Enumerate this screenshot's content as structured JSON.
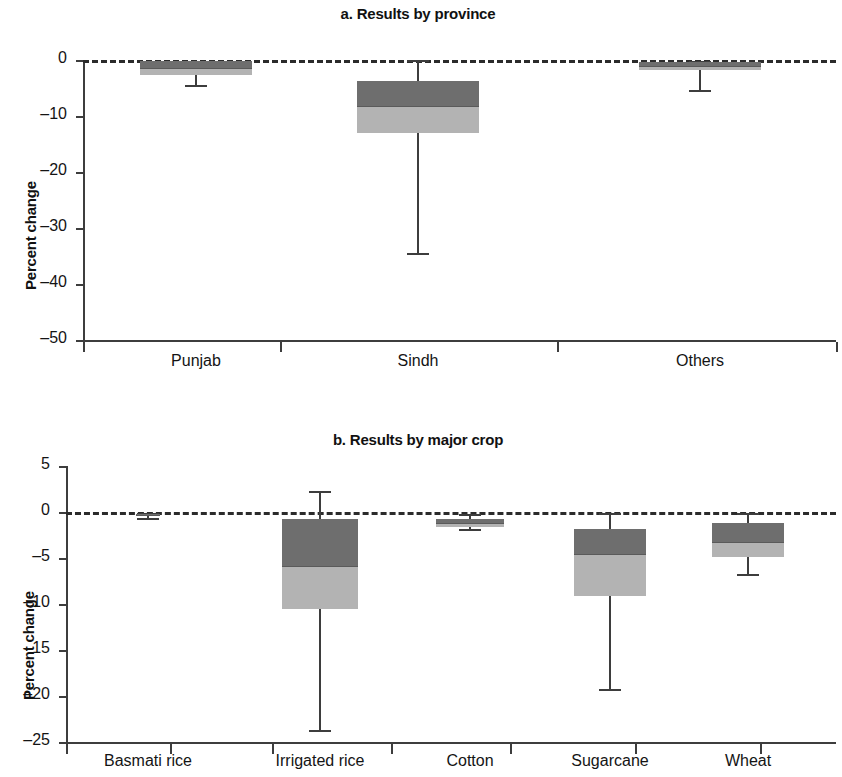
{
  "figure": {
    "width": 836,
    "height": 777,
    "box_upper_color": "#6e6e6e",
    "box_lower_color": "#b3b3b3",
    "axis_color": "#3d3d3d",
    "zero_line_color": "#2b2b2b"
  },
  "chart_data": [
    {
      "type": "box",
      "panel": "a",
      "title": "a. Results by province",
      "xlabel": "",
      "ylabel": "Percent change",
      "ylim": [
        -50,
        0
      ],
      "yticks": [
        0,
        -10,
        -20,
        -30,
        -40,
        -50
      ],
      "ytick_labels": [
        "0",
        "–10",
        "–20",
        "–30",
        "–40",
        "–50"
      ],
      "grid": false,
      "zero_reference_line": 0,
      "categories": [
        "Punjab",
        "Sindh",
        "Others"
      ],
      "boxes": [
        {
          "category": "Punjab",
          "whisker_high": -0.2,
          "q3": -0.2,
          "median": -1.4,
          "q1": -2.7,
          "whisker_low": -4.5
        },
        {
          "category": "Sindh",
          "whisker_high": 0.0,
          "q3": -3.8,
          "median": -8.2,
          "q1": -13.0,
          "whisker_low": -34.5
        },
        {
          "category": "Others",
          "whisker_high": -0.2,
          "q3": -0.4,
          "median": -1.0,
          "q1": -1.8,
          "whisker_low": -5.3
        }
      ]
    },
    {
      "type": "box",
      "panel": "b",
      "title": "b. Results by major crop",
      "xlabel": "",
      "ylabel": "Percent change",
      "ylim": [
        -25,
        5
      ],
      "yticks": [
        5,
        0,
        -5,
        -10,
        -15,
        -20,
        -25
      ],
      "ytick_labels": [
        "5",
        "0",
        "–5",
        "–10",
        "–15",
        "–20",
        "–25"
      ],
      "grid": false,
      "zero_reference_line": 0,
      "categories": [
        "Basmati rice",
        "Irrigated rice",
        "Cotton",
        "Sugarcane",
        "Wheat"
      ],
      "boxes": [
        {
          "category": "Basmati rice",
          "whisker_high": -0.1,
          "q3": -0.2,
          "median": -0.3,
          "q1": -0.4,
          "whisker_low": -0.6
        },
        {
          "category": "Irrigated rice",
          "whisker_high": 2.3,
          "q3": -0.8,
          "median": -5.9,
          "q1": -10.5,
          "whisker_low": -23.7
        },
        {
          "category": "Cotton",
          "whisker_high": -0.2,
          "q3": -0.8,
          "median": -1.2,
          "q1": -1.6,
          "whisker_low": -1.8
        },
        {
          "category": "Sugarcane",
          "whisker_high": -0.1,
          "q3": -1.8,
          "median": -4.6,
          "q1": -9.1,
          "whisker_low": -19.2
        },
        {
          "category": "Wheat",
          "whisker_high": -0.1,
          "q3": -1.2,
          "median": -3.3,
          "q1": -4.9,
          "whisker_low": -6.7
        }
      ]
    }
  ]
}
